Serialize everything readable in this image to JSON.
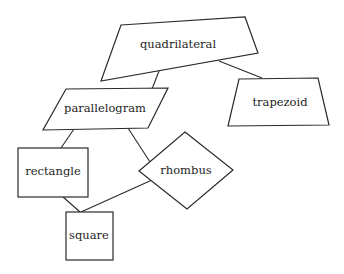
{
  "diagram": {
    "type": "hierarchy",
    "title": "",
    "nodes": [
      {
        "id": "quadrilateral",
        "label": "quadrilateral",
        "shape": "irregular-quadrilateral"
      },
      {
        "id": "parallelogram",
        "label": "parallelogram",
        "shape": "parallelogram"
      },
      {
        "id": "trapezoid",
        "label": "trapezoid",
        "shape": "trapezoid"
      },
      {
        "id": "rectangle",
        "label": "rectangle",
        "shape": "rectangle"
      },
      {
        "id": "rhombus",
        "label": "rhombus",
        "shape": "rhombus"
      },
      {
        "id": "square",
        "label": "square",
        "shape": "square"
      }
    ],
    "edges": [
      {
        "from": "quadrilateral",
        "to": "parallelogram"
      },
      {
        "from": "quadrilateral",
        "to": "trapezoid"
      },
      {
        "from": "parallelogram",
        "to": "rectangle"
      },
      {
        "from": "parallelogram",
        "to": "rhombus"
      },
      {
        "from": "rectangle",
        "to": "square"
      },
      {
        "from": "rhombus",
        "to": "square"
      }
    ]
  },
  "labels": {
    "quadrilateral": "quadrilateral",
    "parallelogram": "parallelogram",
    "trapezoid": "trapezoid",
    "rectangle": "rectangle",
    "rhombus": "rhombus",
    "square": "square"
  },
  "colors": {
    "stroke": "#2a2a2a",
    "fill": "#ffffff",
    "text": "#1e1e1e",
    "background": "#ffffff"
  }
}
